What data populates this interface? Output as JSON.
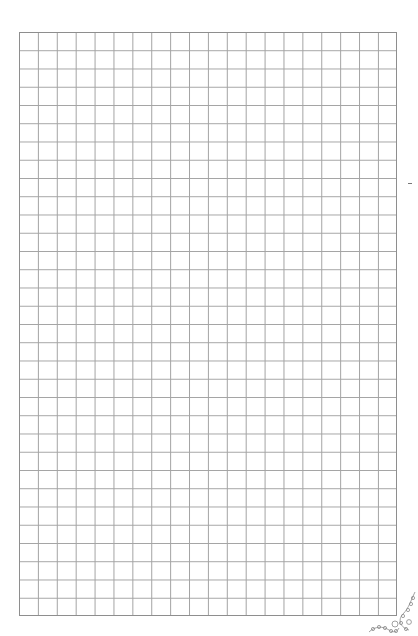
{
  "page": {
    "type": "graph-paper",
    "background": "#ffffff",
    "grid": {
      "columns": 20,
      "rows": 32,
      "line_color": "#a3a3a3",
      "border_color": "#8e8e8e",
      "left": 19,
      "top": 32,
      "width": 378,
      "height": 584
    },
    "decorations": [
      {
        "name": "corner-ornament",
        "position": "bottom-right"
      },
      {
        "name": "margin-mark",
        "position": "right-margin"
      }
    ]
  }
}
